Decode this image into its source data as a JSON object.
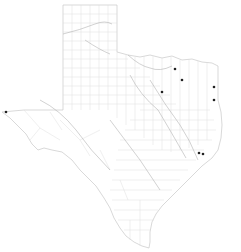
{
  "map": {
    "region": "Texas",
    "layers": [
      "county-boundaries",
      "rivers",
      "point-markers"
    ],
    "colors": {
      "background": "#ffffff",
      "state_border": "#c8c8c8",
      "county_lines": "#dcdcdc",
      "rivers": "#b4b4b4",
      "marker": "#222222"
    },
    "markers": [
      {
        "id": "m1",
        "x": 175,
        "y": 69
      },
      {
        "id": "m2",
        "x": 182,
        "y": 80
      },
      {
        "id": "m3",
        "x": 162,
        "y": 92
      },
      {
        "id": "m4",
        "x": 214,
        "y": 87
      },
      {
        "id": "m5",
        "x": 214,
        "y": 100
      },
      {
        "id": "m6",
        "x": 6,
        "y": 112
      },
      {
        "id": "m7",
        "x": 199,
        "y": 153
      },
      {
        "id": "m8",
        "x": 203,
        "y": 154
      }
    ]
  }
}
